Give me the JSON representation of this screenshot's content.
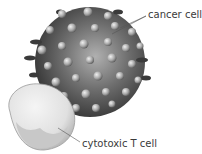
{
  "diagram": {
    "labels": {
      "cancer_cell": "cancer cell",
      "t_cell": "cytotoxic T cell"
    },
    "colors": {
      "cancer_dark": "#3c3c3c",
      "cancer_light": "#a8a8a8",
      "bump": "#c8c8c8",
      "t_cell_fill": "#e6e6e6",
      "t_cell_shade": "#c4c4c4",
      "leader_line": "#555555"
    }
  }
}
